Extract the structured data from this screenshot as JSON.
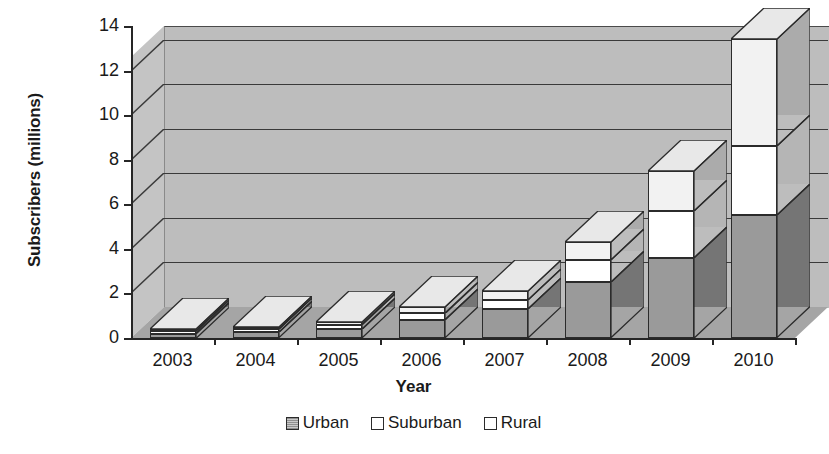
{
  "chart_data": {
    "type": "bar",
    "subtype": "stacked-column-3d",
    "title": "",
    "xlabel": "Year",
    "ylabel": "Subscribers (millions)",
    "categories": [
      "2003",
      "2004",
      "2005",
      "2006",
      "2007",
      "2008",
      "2009",
      "2010"
    ],
    "series": [
      {
        "name": "Urban",
        "values": [
          0.2,
          0.25,
          0.4,
          0.8,
          1.3,
          2.5,
          3.6,
          5.5
        ],
        "color": "#9a9a9a"
      },
      {
        "name": "Suburban",
        "values": [
          0.1,
          0.15,
          0.2,
          0.3,
          0.4,
          1.0,
          2.1,
          3.1
        ],
        "color": "#ffffff"
      },
      {
        "name": "Rural",
        "values": [
          0.1,
          0.1,
          0.1,
          0.3,
          0.4,
          0.8,
          1.8,
          4.8
        ],
        "color": "#f2f2f2"
      }
    ],
    "totals": [
      0.4,
      0.5,
      0.7,
      1.4,
      2.1,
      4.3,
      7.5,
      13.4
    ],
    "ylim": [
      0,
      14
    ],
    "ytick_step": 2,
    "ytick_labels": [
      "0",
      "2",
      "4",
      "6",
      "8",
      "10",
      "12",
      "14"
    ],
    "grid": true,
    "grid_axis": "y",
    "legend_position": "bottom-center",
    "plot_background": "#bdbdbd",
    "floor_color": "#a5a5a5",
    "axis_color": "#262626"
  },
  "axes": {
    "y_title": "Subscribers (millions)",
    "x_title": "Year"
  },
  "legend": {
    "items": [
      {
        "label": "Urban",
        "swatch": "#9a9a9a"
      },
      {
        "label": "Suburban",
        "swatch": "#ffffff"
      },
      {
        "label": "Rural",
        "swatch": "#ffffff"
      }
    ]
  }
}
